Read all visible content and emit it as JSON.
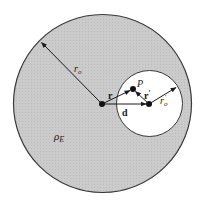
{
  "figure": {
    "colors": {
      "sphere_fill": "#c9c9c9",
      "sphere_stroke": "#3a3a3a",
      "cavity_fill": "#ffffff",
      "vector_color": "#1a1a1a"
    },
    "sphere": {
      "center": [
        102.5,
        103.5
      ],
      "radius": 89
    },
    "cavity": {
      "center": [
        149.5,
        103.5
      ],
      "radius": 33
    },
    "points": {
      "origin": [
        102,
        104
      ],
      "cavity_center": [
        149,
        104
      ],
      "P": [
        133,
        89
      ]
    },
    "labels": {
      "r0": "r",
      "r0_sub": "o",
      "r": "r",
      "r_prime": "r",
      "r_prime_mark": "′",
      "r0_prime": "r",
      "r0_prime_sub": "o",
      "r0_prime_mark": "′",
      "d": "d",
      "P": "P",
      "rhoE": "ρ",
      "rhoE_sub": "E"
    }
  }
}
